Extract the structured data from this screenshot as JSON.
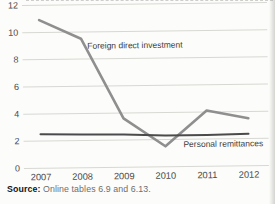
{
  "figure": {
    "source_label": "Source:",
    "source_text": "Online tables 6.9 and 6.13."
  },
  "chart_data": {
    "type": "line",
    "x": [
      2007,
      2008,
      2009,
      2010,
      2011,
      2012
    ],
    "x_tick_labels": [
      "2007",
      "2008",
      "2009",
      "2010",
      "2011",
      "2012"
    ],
    "yticks": [
      0,
      2,
      4,
      6,
      8,
      10,
      12
    ],
    "ylim": [
      0,
      12
    ],
    "xlabel": "",
    "ylabel": "",
    "title": "",
    "grid": true,
    "legend_position": "inline-annotations",
    "series": [
      {
        "name": "Foreign direct investment",
        "values": [
          10.9,
          9.5,
          3.6,
          1.5,
          4.1,
          3.5
        ],
        "color": "#8f8f8f",
        "stroke_width": 2.6
      },
      {
        "name": "Personal remittances",
        "values": [
          2.5,
          2.45,
          2.4,
          2.3,
          2.3,
          2.35
        ],
        "color": "#4b4b4b",
        "stroke_width": 2
      }
    ],
    "annotations": [
      {
        "text": "Foreign direct investment",
        "x": 2008.15,
        "y": 8.75,
        "anchor": "start"
      },
      {
        "text": "Personal remittances",
        "x": 2012.35,
        "y": 1.42,
        "anchor": "end"
      }
    ]
  },
  "colors": {
    "background": "#fcfcfa",
    "grid": "#d7d7d3",
    "tick_text": "#4a4a4a",
    "annotation_text": "#3d3d3d",
    "source_label_text": "#141414",
    "source_body_text": "#6e6e6e"
  }
}
